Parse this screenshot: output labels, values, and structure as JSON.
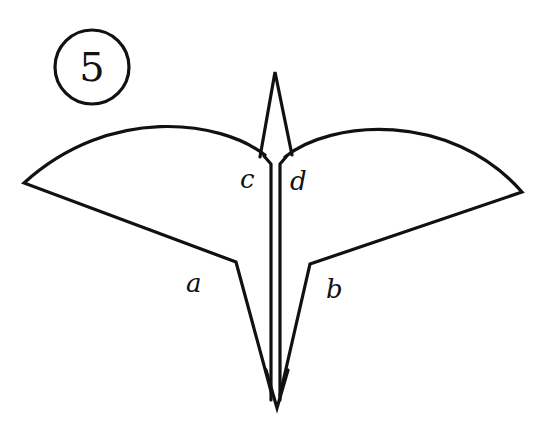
{
  "figure": {
    "step_number": "5",
    "labels": {
      "a": "a",
      "b": "b",
      "c": "c",
      "d": "d"
    },
    "stroke_color": "#111111",
    "background_color": "#ffffff"
  }
}
